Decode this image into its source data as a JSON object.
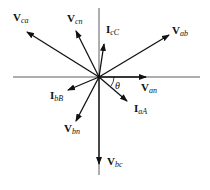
{
  "diagram": {
    "origin": [
      99,
      77
    ],
    "axes": {
      "horizontal": {
        "x1": 13,
        "x2": 200,
        "y": 77
      },
      "vertical": {
        "x": 99,
        "y1": 8,
        "y2": 175
      }
    },
    "angle_label": "θ",
    "phasors": [
      {
        "id": "V_ca",
        "main": "V",
        "sub": "ca",
        "tip": [
          27,
          32
        ],
        "label_pos": [
          13,
          21
        ]
      },
      {
        "id": "V_cn",
        "main": "V",
        "sub": "cn",
        "tip": [
          76,
          31
        ],
        "label_pos": [
          67,
          22
        ]
      },
      {
        "id": "I_cC",
        "main": "I",
        "sub": "cC",
        "tip": [
          104,
          44
        ],
        "label_pos": [
          106,
          33
        ]
      },
      {
        "id": "V_ab",
        "main": "V",
        "sub": "ab",
        "tip": [
          169,
          35
        ],
        "label_pos": [
          172,
          34
        ]
      },
      {
        "id": "V_an",
        "main": "V",
        "sub": "an",
        "tip": [
          146,
          77
        ],
        "label_pos": [
          141,
          91
        ]
      },
      {
        "id": "I_aA",
        "main": "I",
        "sub": "aA",
        "tip": [
          127,
          101
        ],
        "label_pos": [
          134,
          112
        ]
      },
      {
        "id": "I_bB",
        "main": "I",
        "sub": "bB",
        "tip": [
          68,
          90
        ],
        "label_pos": [
          50,
          99
        ]
      },
      {
        "id": "V_bn",
        "main": "V",
        "sub": "bn",
        "tip": [
          76,
          121
        ],
        "label_pos": [
          64,
          132
        ]
      },
      {
        "id": "V_bc",
        "main": "V",
        "sub": "bc",
        "tip": [
          99,
          164
        ],
        "label_pos": [
          107,
          165
        ]
      }
    ]
  }
}
